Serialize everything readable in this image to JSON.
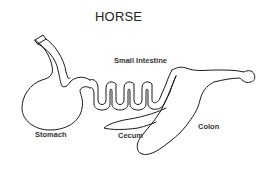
{
  "diagram": {
    "title": "HORSE",
    "labels": {
      "small_intestine": "Small Intestine",
      "stomach": "Stomach",
      "cecum": "Cecum",
      "colon": "Colon"
    },
    "colors": {
      "stroke": "#1a1a1a",
      "background": "#ffffff",
      "text": "#222222"
    }
  }
}
